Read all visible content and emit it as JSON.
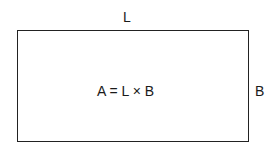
{
  "diagram": {
    "shape": "rectangle",
    "length_label": "L",
    "breadth_label": "B",
    "formula": "A = L × B"
  }
}
